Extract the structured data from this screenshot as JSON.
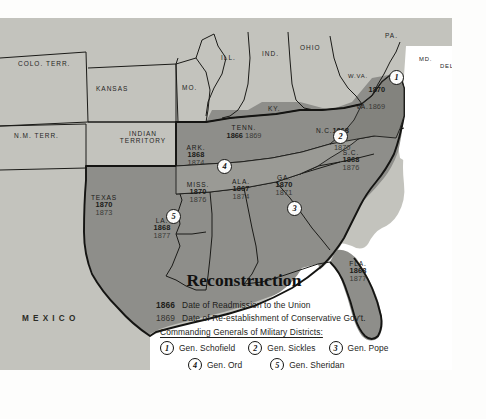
{
  "map": {
    "title": "Reconstruction",
    "mexico_label": "MEXICO",
    "colors": {
      "confederate_fill": "#8e8e8a",
      "union_fill": "#c3c3bd",
      "water_fill": "#ffffff",
      "border_stroke": "#1b1b18"
    },
    "confederate_states": [
      {
        "name": "TEXAS",
        "readmission": "1870",
        "conservative": "1873"
      },
      {
        "name": "ARK.",
        "readmission": "1868",
        "conservative": "1874"
      },
      {
        "name": "LA.",
        "readmission": "1868",
        "conservative": "1877"
      },
      {
        "name": "MISS.",
        "readmission": "1870",
        "conservative": "1876"
      },
      {
        "name": "ALA.",
        "readmission": "1867",
        "conservative": "1874"
      },
      {
        "name": "GA.",
        "readmission": "1870",
        "conservative": "1871"
      },
      {
        "name": "FLA.",
        "readmission": "1868",
        "conservative": "1877"
      },
      {
        "name": "S.C.",
        "readmission": "1868",
        "conservative": "1876"
      },
      {
        "name": "N.C.",
        "readmission": "1868",
        "conservative": "1870"
      },
      {
        "name": "VA.",
        "readmission": "1870",
        "conservative": "1869"
      },
      {
        "name": "TENN.",
        "readmission": "1866",
        "conservative": "1869"
      }
    ],
    "other_regions": [
      {
        "name": "COLO. TERR."
      },
      {
        "name": "N.M. TERR."
      },
      {
        "name": "KANSAS"
      },
      {
        "name": "INDIAN TERRITORY"
      },
      {
        "name": "MO."
      },
      {
        "name": "ILL."
      },
      {
        "name": "IND."
      },
      {
        "name": "OHIO"
      },
      {
        "name": "KY."
      },
      {
        "name": "W.VA."
      },
      {
        "name": "PA."
      },
      {
        "name": "MD."
      },
      {
        "name": "DEL."
      }
    ],
    "district_markers": [
      {
        "number": "1",
        "state": "VA."
      },
      {
        "number": "2",
        "state": "N.C."
      },
      {
        "number": "3",
        "state": "GA."
      },
      {
        "number": "4",
        "state": "ARK."
      },
      {
        "number": "5",
        "state": "LA."
      }
    ]
  },
  "legend": {
    "key": [
      {
        "year": "1866",
        "text": "Date of Readmission to the Union"
      },
      {
        "year": "1869",
        "text": "Date of Re-establishment of Conservative Gov't."
      }
    ],
    "commanders_header": "Commanding Generals of Military Districts:",
    "commanders": [
      {
        "number": "1",
        "name": "Gen. Schofield"
      },
      {
        "number": "2",
        "name": "Gen. Sickles"
      },
      {
        "number": "3",
        "name": "Gen. Pope"
      },
      {
        "number": "4",
        "name": "Gen. Ord"
      },
      {
        "number": "5",
        "name": "Gen. Sheridan"
      }
    ]
  }
}
